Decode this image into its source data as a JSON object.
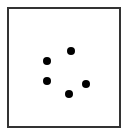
{
  "diagram": {
    "type": "dot-pattern",
    "frame": {
      "border_color": "#333333",
      "background": "#ffffff"
    },
    "dot_color": "#000000",
    "dot_count": 5,
    "dots": [
      {
        "x": 71,
        "y": 51
      },
      {
        "x": 47,
        "y": 61
      },
      {
        "x": 47,
        "y": 81
      },
      {
        "x": 69,
        "y": 94
      },
      {
        "x": 86,
        "y": 84
      }
    ]
  }
}
